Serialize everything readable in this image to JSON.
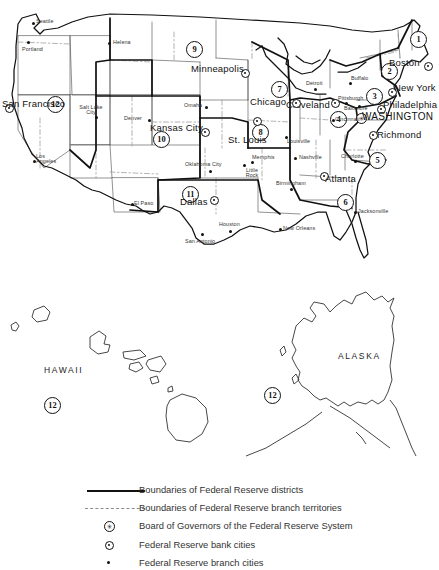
{
  "figure": {
    "type": "map",
    "regions": [
      {
        "name": "HAWAII"
      },
      {
        "name": "ALASKA"
      }
    ]
  },
  "districts": [
    {
      "number": "1",
      "bank_city": "Boston",
      "x": 410,
      "y": 31
    },
    {
      "number": "2",
      "bank_city": "New York",
      "x": 381,
      "y": 63
    },
    {
      "number": "3",
      "bank_city": "Philadelphia",
      "x": 366,
      "y": 88
    },
    {
      "number": "4",
      "bank_city": "Cleveland",
      "x": 330,
      "y": 111
    },
    {
      "number": "5",
      "bank_city": "Richmond",
      "x": 369,
      "y": 152
    },
    {
      "number": "6",
      "bank_city": "Atlanta",
      "x": 337,
      "y": 194
    },
    {
      "number": "7",
      "bank_city": "Chicago",
      "x": 271,
      "y": 81
    },
    {
      "number": "8",
      "bank_city": "St. Louis",
      "x": 252,
      "y": 124
    },
    {
      "number": "9",
      "bank_city": "Minneapolis",
      "x": 186,
      "y": 41
    },
    {
      "number": "10",
      "bank_city": "Kansas City",
      "x": 153,
      "y": 131
    },
    {
      "number": "11",
      "bank_city": "Dallas",
      "x": 182,
      "y": 186
    },
    {
      "number": "12",
      "bank_city": "San Francisco",
      "x": 47,
      "y": 96
    },
    {
      "number": "12",
      "bank_city": "San Francisco",
      "x": 44,
      "y": 397
    },
    {
      "number": "12",
      "bank_city": "San Francisco",
      "x": 264,
      "y": 387
    }
  ],
  "bank_cities": [
    {
      "name": "Boston",
      "label_x": 389,
      "label_y": 58,
      "dot_x": 424,
      "dot_y": 62
    },
    {
      "name": "New York",
      "label_x": 394,
      "label_y": 87,
      "dot_x": 388,
      "dot_y": 88
    },
    {
      "name": "Philadelphia",
      "label_x": 383,
      "label_y": 104,
      "dot_x": 377,
      "dot_y": 105
    },
    {
      "name": "Cleveland",
      "label_x": 286,
      "label_y": 104,
      "dot_x": 331,
      "dot_y": 99
    },
    {
      "name": "Richmond",
      "label_x": 377,
      "label_y": 134,
      "dot_x": 369,
      "dot_y": 131
    },
    {
      "name": "Atlanta",
      "label_x": 325,
      "label_y": 178,
      "dot_x": 320,
      "dot_y": 172
    },
    {
      "name": "Chicago",
      "label_x": 250,
      "label_y": 101,
      "dot_x": 292,
      "dot_y": 99
    },
    {
      "name": "St. Louis",
      "label_x": 228,
      "label_y": 139,
      "dot_x": 253,
      "dot_y": 117
    },
    {
      "name": "Minneapolis",
      "label_x": 191,
      "label_y": 67,
      "dot_x": 241,
      "dot_y": 69
    },
    {
      "name": "Kansas City",
      "label_x": 150,
      "label_y": 126,
      "dot_x": 201,
      "dot_y": 128
    },
    {
      "name": "Dallas",
      "label_x": 180,
      "label_y": 201,
      "dot_x": 210,
      "dot_y": 196
    },
    {
      "name": "San Francisco",
      "label_x": 2,
      "label_y": 103,
      "dot_x": 5,
      "dot_y": 104
    }
  ],
  "board_of_governors": {
    "name": "WASHINGTON",
    "label_x": 362,
    "label_y": 114,
    "dot_x": 356,
    "dot_y": 113
  },
  "branch_cities": [
    {
      "name": "Seattle",
      "label_x": 36,
      "label_y": 19,
      "dot_x": 32,
      "dot_y": 22
    },
    {
      "name": "Portland",
      "label_x": 22,
      "label_y": 47,
      "dot_x": 27,
      "dot_y": 41
    },
    {
      "name": "Helena",
      "label_x": 113,
      "label_y": 41,
      "dot_x": 108,
      "dot_y": 42
    },
    {
      "name": "Salt Lake City",
      "label_x": 78,
      "label_y": 105,
      "dot_x": 95,
      "dot_y": 116
    },
    {
      "name": "Denver",
      "label_x": 124,
      "label_y": 116,
      "dot_x": 148,
      "dot_y": 119
    },
    {
      "name": "Los Angeles",
      "label_x": 36,
      "label_y": 157,
      "dot_x": 33,
      "dot_y": 160
    },
    {
      "name": "El Paso",
      "label_x": 132,
      "label_y": 205,
      "dot_x": 131,
      "dot_y": 203
    },
    {
      "name": "Omaha",
      "label_x": 184,
      "label_y": 103,
      "dot_x": 205,
      "dot_y": 106
    },
    {
      "name": "Oklahoma City",
      "label_x": 185,
      "label_y": 162,
      "dot_x": 209,
      "dot_y": 170
    },
    {
      "name": "San Antonio",
      "label_x": 185,
      "label_y": 240,
      "dot_x": 201,
      "dot_y": 233
    },
    {
      "name": "Houston",
      "label_x": 219,
      "label_y": 223,
      "dot_x": 229,
      "dot_y": 230
    },
    {
      "name": "Little Rock",
      "label_x": 245,
      "label_y": 168,
      "dot_x": 243,
      "dot_y": 164
    },
    {
      "name": "Memphis",
      "label_x": 252,
      "label_y": 157,
      "dot_x": 251,
      "dot_y": 161
    },
    {
      "name": "New Orleans",
      "label_x": 283,
      "label_y": 227,
      "dot_x": 279,
      "dot_y": 228
    },
    {
      "name": "Birmingham",
      "label_x": 276,
      "label_y": 182,
      "dot_x": 290,
      "dot_y": 188
    },
    {
      "name": "Nashville",
      "label_x": 299,
      "label_y": 156,
      "dot_x": 294,
      "dot_y": 157
    },
    {
      "name": "Louisville",
      "label_x": 287,
      "label_y": 140,
      "dot_x": 285,
      "dot_y": 136
    },
    {
      "name": "Cincinnati",
      "label_x": 335,
      "label_y": 120,
      "dot_x": 332,
      "dot_y": 119
    },
    {
      "name": "Detroit",
      "label_x": 306,
      "label_y": 81,
      "dot_x": 314,
      "dot_y": 88
    },
    {
      "name": "Pittsburgh",
      "label_x": 338,
      "label_y": 97,
      "dot_x": 345,
      "dot_y": 102
    },
    {
      "name": "Buffalo",
      "label_x": 351,
      "label_y": 78,
      "dot_x": 349,
      "dot_y": 82
    },
    {
      "name": "Baltimore",
      "label_x": 348,
      "label_y": 107,
      "dot_x": 358,
      "dot_y": 105
    },
    {
      "name": "Charlotte",
      "label_x": 341,
      "label_y": 155,
      "dot_x": 354,
      "dot_y": 160
    },
    {
      "name": "Jacksonville",
      "label_x": 356,
      "label_y": 212,
      "dot_x": 354,
      "dot_y": 211
    }
  ],
  "legend": {
    "items": [
      {
        "symbol": "solid-line",
        "label": "Boundaries of Federal Reserve districts"
      },
      {
        "symbol": "dashed-line",
        "label": "Boundaries of Federal Reserve branch territories"
      },
      {
        "symbol": "board-mark",
        "label": "Board of Governors of the Federal Reserve System"
      },
      {
        "symbol": "bank-mark",
        "label": "Federal Reserve bank cities"
      },
      {
        "symbol": "branch-mark",
        "label": "Federal Reserve branch cities"
      }
    ]
  }
}
